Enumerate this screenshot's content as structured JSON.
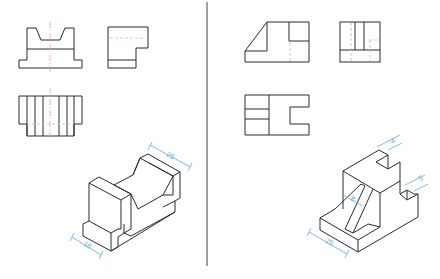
{
  "figure": {
    "type": "engineering-drawing-exercise",
    "panels": [
      {
        "id": "left",
        "views": [
          "front-view",
          "side-view",
          "top-view"
        ],
        "isometric": {
          "dimensions": [
            {
              "label": "25",
              "position": "top-right edge"
            },
            {
              "label": "18",
              "position": "bottom-left edge"
            }
          ]
        }
      },
      {
        "id": "right",
        "views": [
          "front-view",
          "side-view",
          "top-view"
        ],
        "isometric": {
          "dimensions": [
            {
              "label": "4",
              "position": "top step"
            },
            {
              "label": "5",
              "position": "right step"
            },
            {
              "label": "8",
              "position": "rib width"
            },
            {
              "label": "25",
              "position": "bottom-left edge"
            }
          ]
        }
      }
    ]
  },
  "colors": {
    "line": "#2a2a2a",
    "centerline": "#e8a888",
    "hidden": "#9fd4e6",
    "dimension": "#5aaee0"
  },
  "labels": {
    "left_dim_top": "25",
    "left_dim_bottom": "18",
    "right_dim_top": "4",
    "right_dim_right": "5",
    "right_dim_rib": "8",
    "right_dim_bottom": "25"
  }
}
